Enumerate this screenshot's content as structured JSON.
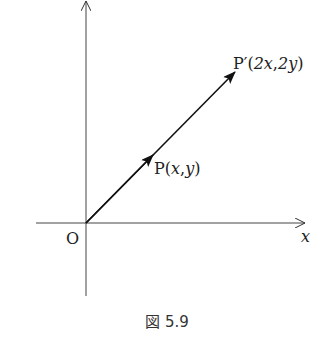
{
  "figure": {
    "caption": "図 5.9",
    "axes": {
      "x_label": "x",
      "origin_label": "O"
    },
    "points": {
      "p": {
        "name": "P",
        "open": "(",
        "x": "x",
        "sep": ",",
        "y": "y",
        "close": ")"
      },
      "p_prime": {
        "name": "P′",
        "open": "(",
        "x": "2x",
        "sep": ",",
        "y": "2y",
        "close": ")"
      }
    },
    "stroke_color": "#222222"
  }
}
